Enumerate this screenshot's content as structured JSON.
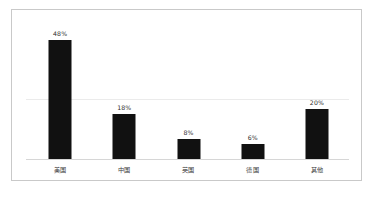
{
  "chart_data": {
    "type": "bar",
    "title": "",
    "subtitle": "",
    "xlabel": "",
    "ylabel": "",
    "categories": [
      "美国",
      "中国",
      "英国",
      "德国",
      "其他"
    ],
    "values": [
      48,
      18,
      8,
      6,
      20
    ],
    "value_labels": [
      "48%",
      "18%",
      "8%",
      "6%",
      "20%"
    ],
    "ylim": [
      0,
      52
    ],
    "grid": true,
    "gridlines": [
      24
    ],
    "legend": null,
    "legend_position": "none",
    "series": [
      {
        "name": "",
        "values": [
          48,
          18,
          8,
          6,
          20
        ]
      }
    ],
    "annotations": []
  },
  "style": {
    "bar_color": "#111111",
    "background": "#ffffff",
    "frame_border": "#c9c9c9",
    "axis_line": "#d6d6d6",
    "gridline": "#ebebeb",
    "label_color": "#3a3a3a",
    "value_color": "#2b2b2b"
  }
}
